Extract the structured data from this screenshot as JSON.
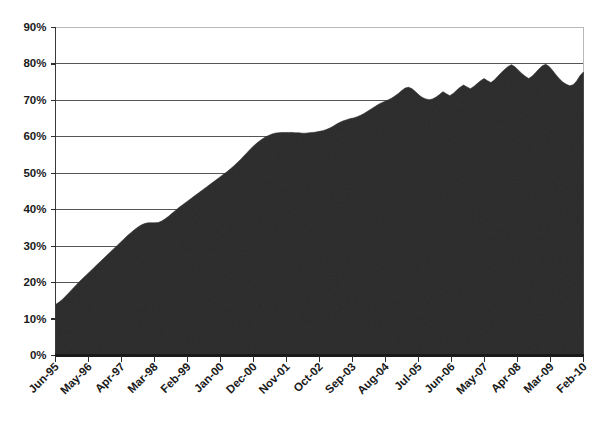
{
  "chart_data": {
    "type": "area",
    "title": "",
    "subtitle": "",
    "xlabel": "",
    "ylabel": "",
    "grid": true,
    "legend": "none",
    "ylim": [
      0,
      90
    ],
    "ytick_labels": [
      "90%",
      "80%",
      "70%",
      "60%",
      "50%",
      "40%",
      "30%",
      "20%",
      "10%",
      "0%"
    ],
    "ytick_values": [
      90,
      80,
      70,
      60,
      50,
      40,
      30,
      20,
      10,
      0
    ],
    "xtick_labels": [
      "Jun-95",
      "May-96",
      "Apr-97",
      "Mar-98",
      "Feb-99",
      "Jan-00",
      "Dec-00",
      "Nov-01",
      "Oct-02",
      "Sep-03",
      "Aug-04",
      "Jul-05",
      "Jun-06",
      "May-07",
      "Apr-08",
      "Mar-09",
      "Feb-10"
    ],
    "series": [
      {
        "name": "Series 1",
        "color": "#2b2b2b",
        "values": [
          14.0,
          14.6,
          15.4,
          16.3,
          17.3,
          18.3,
          19.3,
          20.3,
          21.2,
          22.1,
          23.0,
          23.9,
          24.8,
          25.7,
          26.6,
          27.5,
          28.4,
          29.3,
          30.2,
          31.1,
          32.0,
          32.9,
          33.7,
          34.5,
          35.2,
          35.8,
          36.2,
          36.4,
          36.4,
          36.4,
          36.5,
          36.9,
          37.5,
          38.2,
          39.0,
          39.8,
          40.6,
          41.3,
          42.0,
          42.7,
          43.4,
          44.1,
          44.8,
          45.5,
          46.2,
          46.9,
          47.6,
          48.3,
          49.0,
          49.7,
          50.4,
          51.2,
          52.0,
          52.9,
          53.8,
          54.8,
          55.8,
          56.8,
          57.7,
          58.5,
          59.2,
          59.8,
          60.3,
          60.7,
          61.0,
          61.1,
          61.2,
          61.2,
          61.2,
          61.2,
          61.1,
          61.1,
          61.0,
          61.0,
          61.1,
          61.2,
          61.3,
          61.5,
          61.7,
          62.0,
          62.4,
          62.9,
          63.5,
          64.0,
          64.4,
          64.7,
          65.0,
          65.2,
          65.5,
          65.9,
          66.4,
          67.0,
          67.6,
          68.2,
          68.8,
          69.3,
          69.7,
          70.1,
          70.6,
          71.2,
          71.9,
          72.7,
          73.4,
          73.6,
          73.2,
          72.4,
          71.5,
          70.8,
          70.4,
          70.2,
          70.4,
          70.9,
          71.6,
          72.4,
          71.8,
          71.3,
          71.9,
          72.8,
          73.6,
          74.2,
          73.7,
          73.2,
          73.8,
          74.6,
          75.4,
          76.0,
          75.4,
          74.9,
          75.6,
          76.6,
          77.6,
          78.5,
          79.3,
          79.8,
          79.2,
          78.3,
          77.4,
          76.6,
          76.0,
          76.6,
          77.6,
          78.6,
          79.5,
          79.9,
          79.3,
          78.2,
          77.0,
          75.9,
          75.0,
          74.4,
          74.0,
          74.3,
          75.3,
          76.8,
          77.8
        ]
      }
    ]
  },
  "axes": {
    "y_axis_name": "percentage-axis",
    "x_axis_name": "date-axis"
  }
}
